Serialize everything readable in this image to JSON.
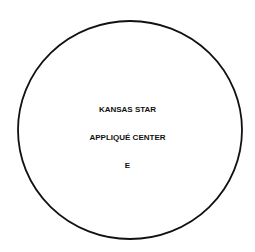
{
  "pattern": {
    "shape": "circle",
    "stroke_color": "#111111",
    "lines": [
      "KANSAS STAR",
      "APPLIQUÉ CENTER",
      "E"
    ]
  }
}
